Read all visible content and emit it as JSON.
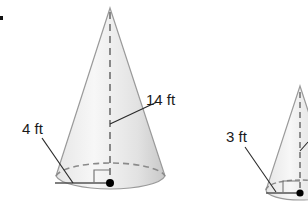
{
  "diagram": {
    "bullet": "•",
    "cones": [
      {
        "id": "large-cone",
        "height_label": "14 ft",
        "radius_label": "4 ft"
      },
      {
        "id": "small-cone",
        "radius_label": "3 ft"
      }
    ],
    "colors": {
      "cone_fill_light": "#f4f4f4",
      "cone_fill_dark": "#cfcfcf",
      "outline": "#8a8a8a",
      "dashed": "#6e6e6e",
      "leader": "#2a2a2a",
      "dot": "#000000"
    }
  }
}
